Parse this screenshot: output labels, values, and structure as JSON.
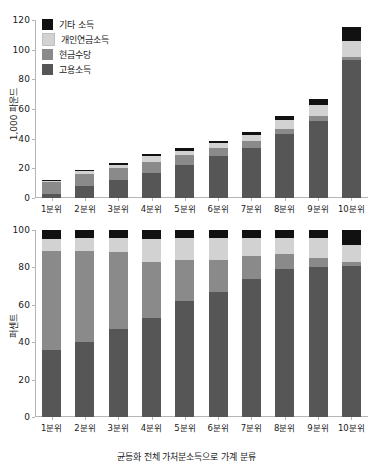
{
  "figure": {
    "xaxis_title": "균등화 전체 가처분소득으로 가계 분류"
  },
  "legend": {
    "position": "top-left",
    "items": [
      {
        "label": "기타 소득",
        "color": "#111111",
        "key": "other_income"
      },
      {
        "label": "개인연금소득",
        "color": "#d2d2d2",
        "key": "private_pension_income"
      },
      {
        "label": "현금수당",
        "color": "#8a8a8a",
        "key": "cash_benefits"
      },
      {
        "label": "고용소득",
        "color": "#565656",
        "key": "employment_income"
      }
    ]
  },
  "chart_data": [
    {
      "type": "bar",
      "id": "top-panel",
      "stacked": true,
      "title": "",
      "xlabel": "균등화 전체 가처분소득으로 가계 분류",
      "ylabel": "1,000 파운드",
      "ylim": [
        0,
        120
      ],
      "yticks": [
        0,
        20,
        40,
        60,
        80,
        100,
        120
      ],
      "grid": false,
      "categories": [
        "1분위",
        "2분위",
        "3분위",
        "4분위",
        "5분위",
        "6분위",
        "7분위",
        "8분위",
        "9분위",
        "10분위"
      ],
      "series": [
        {
          "name": "고용소득",
          "color": "#565656",
          "values": [
            3.0,
            8.0,
            12.0,
            17.0,
            22.5,
            28.5,
            34.0,
            43.0,
            52.0,
            93.0
          ]
        },
        {
          "name": "현금수당",
          "color": "#8a8a8a",
          "values": [
            7.5,
            8.5,
            8.0,
            7.0,
            6.5,
            5.5,
            4.5,
            3.5,
            3.0,
            2.0
          ]
        },
        {
          "name": "개인연금소득",
          "color": "#d2d2d2",
          "values": [
            1.0,
            1.5,
            2.0,
            4.5,
            3.0,
            3.0,
            4.0,
            6.0,
            7.5,
            11.0
          ]
        },
        {
          "name": "기타 소득",
          "color": "#111111",
          "values": [
            0.5,
            1.0,
            1.5,
            1.5,
            1.5,
            1.5,
            2.0,
            3.0,
            4.0,
            9.0
          ]
        }
      ],
      "totals": [
        12.0,
        19.0,
        23.5,
        30.0,
        33.5,
        38.5,
        44.5,
        55.5,
        66.5,
        115.0
      ]
    },
    {
      "type": "bar",
      "id": "bottom-panel",
      "stacked": true,
      "title": "",
      "xlabel": "균등화 전체 가처분소득으로 가계 분류",
      "ylabel": "퍼센트",
      "ylim": [
        0,
        100
      ],
      "yticks": [
        0,
        20,
        40,
        60,
        80,
        100
      ],
      "grid": false,
      "categories": [
        "1분위",
        "2분위",
        "3분위",
        "4분위",
        "5분위",
        "6분위",
        "7분위",
        "8분위",
        "9분위",
        "10분위"
      ],
      "series": [
        {
          "name": "고용소득",
          "color": "#565656",
          "values": [
            36.0,
            40.0,
            47.0,
            53.0,
            62.0,
            67.0,
            74.0,
            79.0,
            80.0,
            81.0
          ]
        },
        {
          "name": "현금수당",
          "color": "#8a8a8a",
          "values": [
            53.0,
            49.0,
            41.0,
            30.0,
            22.0,
            17.0,
            12.0,
            8.0,
            5.0,
            2.0
          ]
        },
        {
          "name": "개인연금소득",
          "color": "#d2d2d2",
          "values": [
            6.0,
            7.0,
            8.0,
            12.0,
            12.0,
            12.0,
            10.0,
            9.0,
            11.0,
            9.0
          ]
        },
        {
          "name": "기타 소득",
          "color": "#111111",
          "values": [
            5.0,
            4.0,
            4.0,
            5.0,
            4.0,
            4.0,
            4.0,
            4.0,
            4.0,
            8.0
          ]
        }
      ],
      "totals": [
        100,
        100,
        100,
        100,
        100,
        100,
        100,
        100,
        100,
        100
      ]
    }
  ]
}
